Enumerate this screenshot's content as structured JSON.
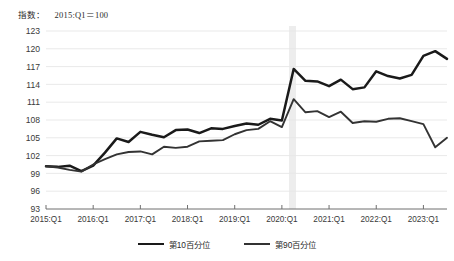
{
  "header": {
    "unit_prefix": "指数：",
    "base_note": "2015:Q1＝100"
  },
  "legend": {
    "items": [
      {
        "label": "第10百分位",
        "color": "#1a1a1a",
        "name": "p10"
      },
      {
        "label": "第90百分位",
        "color": "#333333",
        "name": "p90"
      }
    ]
  },
  "chart_data": {
    "type": "line",
    "title": "",
    "subtitle": "",
    "xlabel": "",
    "ylabel": "指数：2015:Q1＝100",
    "ylim": [
      93,
      123
    ],
    "ytick_labels": [
      "93",
      "96",
      "99",
      "102",
      "105",
      "108",
      "111",
      "114",
      "117",
      "120",
      "123"
    ],
    "ytick_values": [
      93,
      96,
      99,
      102,
      105,
      108,
      111,
      114,
      117,
      120,
      123
    ],
    "xtick_labels": [
      "2015:Q1",
      "2016:Q1",
      "2017:Q1",
      "2018:Q1",
      "2019:Q1",
      "2020:Q1",
      "2021:Q1",
      "2022:Q1",
      "2023:Q1"
    ],
    "xtick_indices": [
      0,
      4,
      8,
      12,
      16,
      20,
      24,
      28,
      32
    ],
    "grid": true,
    "legend_position": "bottom",
    "shaded_region": {
      "label": "recession-band",
      "start_index": 20.6,
      "end_index": 21.2,
      "color": "#ededed"
    },
    "x": [
      "2015:Q1",
      "2015:Q2",
      "2015:Q3",
      "2015:Q4",
      "2016:Q1",
      "2016:Q2",
      "2016:Q3",
      "2016:Q4",
      "2017:Q1",
      "2017:Q2",
      "2017:Q3",
      "2017:Q4",
      "2018:Q1",
      "2018:Q2",
      "2018:Q3",
      "2018:Q4",
      "2019:Q1",
      "2019:Q2",
      "2019:Q3",
      "2019:Q4",
      "2020:Q1",
      "2020:Q2",
      "2020:Q3",
      "2020:Q4",
      "2021:Q1",
      "2021:Q2",
      "2021:Q3",
      "2021:Q4",
      "2022:Q1",
      "2022:Q2",
      "2022:Q3",
      "2022:Q4",
      "2023:Q1",
      "2023:Q2",
      "2023:Q3"
    ],
    "series": [
      {
        "name": "第10百分位",
        "color": "#1a1a1a",
        "width": 2.5,
        "values": [
          100.2,
          100.1,
          100.3,
          99.4,
          100.3,
          102.5,
          104.9,
          104.3,
          106.0,
          105.5,
          105.1,
          106.3,
          106.4,
          105.8,
          106.6,
          106.5,
          107.0,
          107.4,
          107.2,
          108.2,
          107.9,
          116.6,
          114.6,
          114.5,
          113.7,
          114.8,
          113.2,
          113.5,
          116.2,
          115.4,
          115.0,
          115.6,
          118.8,
          119.6,
          118.3
        ]
      },
      {
        "name": "第90百分位",
        "color": "#333333",
        "width": 1.9,
        "values": [
          100.2,
          100.0,
          99.6,
          99.3,
          100.5,
          101.4,
          102.2,
          102.6,
          102.7,
          102.2,
          103.5,
          103.3,
          103.5,
          104.4,
          104.5,
          104.6,
          105.6,
          106.3,
          106.5,
          107.8,
          106.8,
          111.5,
          109.3,
          109.5,
          108.5,
          109.4,
          107.5,
          107.8,
          107.7,
          108.2,
          108.3,
          107.8,
          107.3,
          103.4,
          105.0
        ]
      }
    ]
  }
}
